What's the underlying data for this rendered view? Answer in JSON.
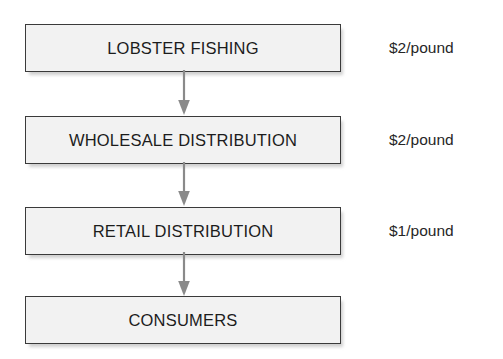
{
  "diagram": {
    "type": "flowchart",
    "orientation": "vertical",
    "colors": {
      "background": "#ffffff",
      "box_fill": "#f2f2f2",
      "box_border": "#3a3a3a",
      "text": "#1c1c1c",
      "arrow": "#8a8a8a",
      "label_text": "#262626"
    },
    "nodes": [
      {
        "id": "lobster-fishing",
        "label": "LOBSTER FISHING",
        "price": "$2/pound"
      },
      {
        "id": "wholesale-distribution",
        "label": "WHOLESALE DISTRIBUTION",
        "price": "$2/pound"
      },
      {
        "id": "retail-distribution",
        "label": "RETAIL DISTRIBUTION",
        "price": "$1/pound"
      },
      {
        "id": "consumers",
        "label": "CONSUMERS",
        "price": ""
      }
    ],
    "connectors": [
      {
        "id": "arrow-1",
        "from": "lobster-fishing",
        "to": "wholesale-distribution",
        "icon": "arrow-down-icon"
      },
      {
        "id": "arrow-2",
        "from": "wholesale-distribution",
        "to": "retail-distribution",
        "icon": "arrow-down-icon"
      },
      {
        "id": "arrow-3",
        "from": "retail-distribution",
        "to": "consumers",
        "icon": "arrow-down-icon"
      }
    ]
  }
}
